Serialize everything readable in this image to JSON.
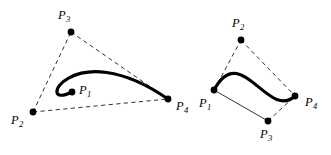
{
  "figure": {
    "background_color": "#ffffff",
    "stroke_color": "#000000",
    "curve_color": "#000000",
    "hull_color": "#1a1a1a",
    "width": 331,
    "height": 155
  },
  "diagrams": [
    {
      "id": "left-diagram",
      "name": "looped-cubic-bezier",
      "curve": {
        "type": "cubic-bezier",
        "start": [
          72,
          92
        ],
        "control_1": [
          33,
          112
        ],
        "control_2": [
          71,
          32
        ],
        "end": [
          168,
          99
        ],
        "path": "M 72 92 C 33 112, 71 32, 168 99"
      },
      "hull_segments": [
        {
          "from": "P2",
          "to": "P3",
          "style": "dashed"
        },
        {
          "from": "P3",
          "to": "P4",
          "style": "dashed"
        },
        {
          "from": "P2",
          "to": "P4",
          "style": "dashed"
        }
      ],
      "points": [
        {
          "key": "P1",
          "letter": "P",
          "subscript": "1",
          "x": 72,
          "y": 92,
          "label_x": 79,
          "label_y": 84
        },
        {
          "key": "P2",
          "letter": "P",
          "subscript": "2",
          "x": 33,
          "y": 112,
          "label_x": 11,
          "label_y": 114
        },
        {
          "key": "P3",
          "letter": "P",
          "subscript": "3",
          "x": 71,
          "y": 32,
          "label_x": 58,
          "label_y": 9
        },
        {
          "key": "P4",
          "letter": "P",
          "subscript": "4",
          "x": 168,
          "y": 99,
          "label_x": 176,
          "label_y": 100
        }
      ]
    },
    {
      "id": "right-diagram",
      "name": "s-shaped-cubic-bezier",
      "curve": {
        "type": "cubic-bezier",
        "start": [
          214,
          90
        ],
        "control_1": [
          241,
          40
        ],
        "control_2": [
          268,
          121
        ],
        "end": [
          295,
          96
        ],
        "path": "M 214 90 C 241 40, 268 121, 295 96"
      },
      "hull_segments": [
        {
          "from": "P1",
          "to": "P2",
          "style": "dashed"
        },
        {
          "from": "P2",
          "to": "P4",
          "style": "dashed"
        },
        {
          "from": "P3",
          "to": "P4",
          "style": "dashed"
        },
        {
          "from": "P1",
          "to": "P3",
          "style": "solid"
        }
      ],
      "points": [
        {
          "key": "P1",
          "letter": "P",
          "subscript": "1",
          "x": 214,
          "y": 90,
          "label_x": 199,
          "label_y": 97
        },
        {
          "key": "P2",
          "letter": "P",
          "subscript": "2",
          "x": 241,
          "y": 40,
          "label_x": 232,
          "label_y": 17
        },
        {
          "key": "P3",
          "letter": "P",
          "subscript": "3",
          "x": 268,
          "y": 121,
          "label_x": 260,
          "label_y": 128
        },
        {
          "key": "P4",
          "letter": "P",
          "subscript": "4",
          "x": 295,
          "y": 96,
          "label_x": 305,
          "label_y": 96
        }
      ]
    }
  ],
  "labels": {
    "p1": "P",
    "p2": "P",
    "p3": "P",
    "p4": "P",
    "sub1": "1",
    "sub2": "2",
    "sub3": "3",
    "sub4": "4"
  }
}
